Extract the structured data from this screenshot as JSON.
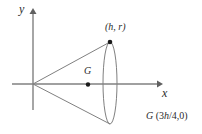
{
  "figure": {
    "background_color": "#ffffff",
    "line_color": "#808080",
    "text_color": "#2b2b2b",
    "width": 202,
    "height": 134
  },
  "axes": {
    "x_label": "x",
    "y_label": "y",
    "origin": {
      "x": 33,
      "y": 84
    },
    "x_axis": {
      "x1": 12,
      "y1": 84,
      "x2": 160,
      "y2": 84
    },
    "y_axis": {
      "x1": 33,
      "y1": 110,
      "x2": 33,
      "y2": 10
    }
  },
  "labels": {
    "top_point": "(h, r)",
    "centroid": "G",
    "caption_symbol": "G",
    "caption_open": " (3",
    "caption_h": "h",
    "caption_rest": "/4,0)"
  },
  "geometry": {
    "apex": {
      "x": 33,
      "y": 84
    },
    "top_point": {
      "x": 110,
      "y": 42
    },
    "bottom_point": {
      "x": 110,
      "y": 124
    },
    "ellipse": {
      "cx": 110,
      "cy": 83,
      "rx": 7,
      "ry": 41
    },
    "centroid_point": {
      "x": 88,
      "y": 85
    }
  }
}
